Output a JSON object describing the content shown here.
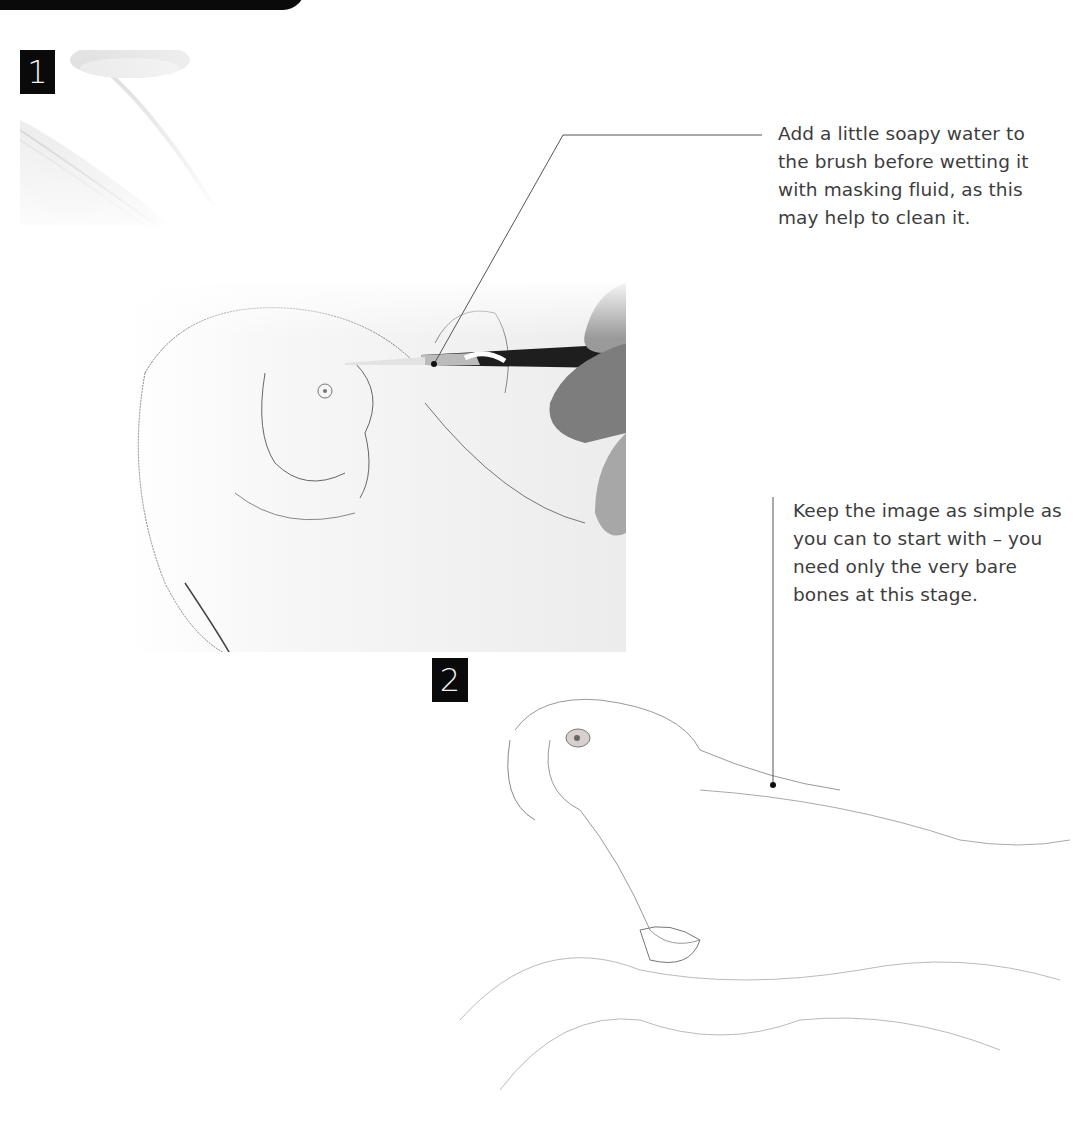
{
  "header": {
    "title": "Getting started",
    "background_color": "#0a0a0a"
  },
  "steps": [
    {
      "number": "1",
      "image": "faded-masking-fluid-jar"
    },
    {
      "number": "2",
      "image": "parrot-pencil-sketch-on-perch"
    }
  ],
  "photo": {
    "description": "brush applying masking fluid to parrot pencil sketch",
    "icon": "paintbrush-photo"
  },
  "captions": [
    {
      "lines": [
        "Add a little soapy water to",
        "the brush before wetting it",
        "with masking fluid, as this",
        "may help to clean it."
      ]
    },
    {
      "lines": [
        "Keep the image as simple as",
        "you can to start with – you",
        "need only the very bare",
        "bones at this stage."
      ]
    }
  ],
  "colors": {
    "badge": "#0a0a0a",
    "badge_text": "#f2f2f2",
    "text": "#3d3d3d",
    "leader_line": "#555555"
  }
}
